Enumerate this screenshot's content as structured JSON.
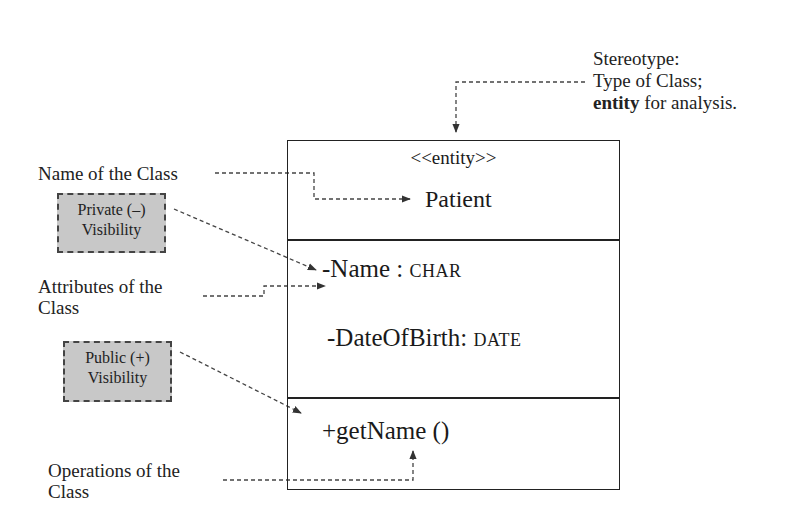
{
  "diagram": {
    "type": "UML class diagram (annotated)",
    "class": {
      "stereotype": "<<entity>>",
      "name": "Patient",
      "attributes": [
        {
          "visibility": "-",
          "name": "-Name :",
          "type": "CHAR"
        },
        {
          "visibility": "-",
          "name": "-DateOfBirth:",
          "type": "DATE"
        }
      ],
      "operations": [
        {
          "visibility": "+",
          "signature": "+getName ()"
        }
      ]
    },
    "annotations": {
      "stereotype_note": {
        "line1": "Stereotype:",
        "line2": "Type of Class;",
        "line3_bold": "entity",
        "line3_rest": " for analysis."
      },
      "class_name_label": "Name of the Class",
      "private_visibility": {
        "line1": "Private (–)",
        "line2": "Visibility"
      },
      "attributes_label": {
        "line1": "Attributes of the",
        "line2": "Class"
      },
      "public_visibility": {
        "line1": "Public (+)",
        "line2": "Visibility"
      },
      "operations_label": {
        "line1": "Operations of the",
        "line2": "Class"
      }
    },
    "colors": {
      "line": "#222222",
      "visibility_box_fill": "#c8c8c8",
      "visibility_box_border": "#444444",
      "arrow": "#333333"
    }
  }
}
